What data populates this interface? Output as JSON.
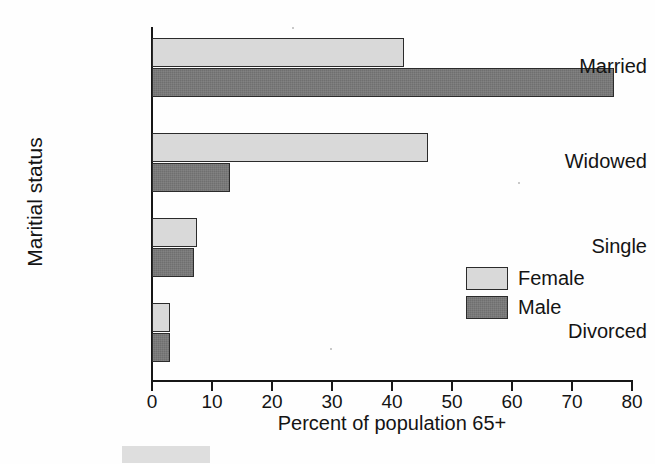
{
  "chart_data": {
    "type": "bar",
    "orientation": "horizontal",
    "title": "",
    "xlabel": "Percent of population 65+",
    "ylabel": "Maritial status",
    "categories": [
      "Married",
      "Widowed",
      "Single",
      "Divorced"
    ],
    "series": [
      {
        "name": "Female",
        "color": "#d9d9d9",
        "values": [
          42,
          46,
          7.5,
          3
        ]
      },
      {
        "name": "Male",
        "color": "#6f6f6f",
        "values": [
          77,
          13,
          7,
          3
        ]
      }
    ],
    "xlim": [
      0,
      80
    ],
    "xticks": [
      0,
      10,
      20,
      30,
      40,
      50,
      60,
      70,
      80
    ],
    "xtick_labels": [
      "0",
      "10",
      "20",
      "30",
      "40",
      "50",
      "60",
      "70",
      "80"
    ],
    "grid": false,
    "legend_position": "lower-right",
    "legend_entries": [
      "Female",
      "Male"
    ]
  },
  "axes": {
    "x_title": "Percent of population 65+",
    "y_title": "Maritial status"
  },
  "legend": {
    "female_label": "Female",
    "male_label": "Male"
  }
}
